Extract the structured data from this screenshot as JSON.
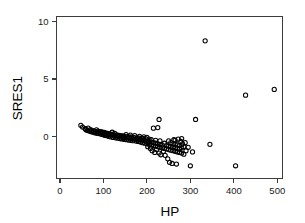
{
  "chart_data": {
    "type": "scatter",
    "title": "",
    "xlabel": "HP",
    "ylabel": "SRES1",
    "xlim": [
      -8,
      512
    ],
    "ylim": [
      -3.6,
      10.4
    ],
    "xticks": [
      0,
      100,
      200,
      300,
      400,
      500
    ],
    "yticks": [
      0,
      5,
      10
    ],
    "xtick_labels": [
      "0",
      "100",
      "200",
      "300",
      "400",
      "500"
    ],
    "ytick_labels": [
      "0",
      "5",
      "10"
    ],
    "grid": false,
    "legend": null,
    "marker": "open-circle",
    "marker_color": "#000000",
    "marker_size": 4.2,
    "points": [
      [
        48,
        1.0
      ],
      [
        52,
        0.85
      ],
      [
        58,
        0.7
      ],
      [
        60,
        0.62
      ],
      [
        63,
        0.55
      ],
      [
        65,
        0.75
      ],
      [
        67,
        0.5
      ],
      [
        70,
        0.62
      ],
      [
        72,
        0.45
      ],
      [
        74,
        0.55
      ],
      [
        76,
        0.4
      ],
      [
        78,
        0.5
      ],
      [
        80,
        0.35
      ],
      [
        82,
        0.45
      ],
      [
        84,
        0.6
      ],
      [
        85,
        0.3
      ],
      [
        87,
        0.42
      ],
      [
        88,
        0.5
      ],
      [
        90,
        0.28
      ],
      [
        92,
        0.38
      ],
      [
        94,
        0.45
      ],
      [
        95,
        0.22
      ],
      [
        96,
        0.33
      ],
      [
        98,
        0.4
      ],
      [
        100,
        0.18
      ],
      [
        101,
        0.3
      ],
      [
        102,
        0.38
      ],
      [
        104,
        0.12
      ],
      [
        105,
        0.25
      ],
      [
        106,
        0.33
      ],
      [
        108,
        0.1
      ],
      [
        110,
        0.2
      ],
      [
        110,
        0.3
      ],
      [
        112,
        0.05
      ],
      [
        113,
        0.18
      ],
      [
        115,
        0.26
      ],
      [
        116,
        0.0
      ],
      [
        118,
        0.14
      ],
      [
        120,
        0.22
      ],
      [
        120,
        0.4
      ],
      [
        122,
        -0.05
      ],
      [
        124,
        0.1
      ],
      [
        125,
        0.18
      ],
      [
        126,
        0.3
      ],
      [
        128,
        -0.08
      ],
      [
        130,
        0.06
      ],
      [
        131,
        0.16
      ],
      [
        133,
        -0.12
      ],
      [
        135,
        0.02
      ],
      [
        136,
        0.12
      ],
      [
        138,
        -0.15
      ],
      [
        140,
        -0.02
      ],
      [
        140,
        0.1
      ],
      [
        142,
        -0.18
      ],
      [
        145,
        -0.05
      ],
      [
        145,
        0.08
      ],
      [
        148,
        -0.22
      ],
      [
        150,
        -0.08
      ],
      [
        150,
        0.05
      ],
      [
        152,
        0.2
      ],
      [
        153,
        -0.25
      ],
      [
        155,
        -0.1
      ],
      [
        155,
        0.02
      ],
      [
        158,
        -0.28
      ],
      [
        160,
        -0.12
      ],
      [
        160,
        0.0
      ],
      [
        162,
        0.15
      ],
      [
        163,
        -0.3
      ],
      [
        165,
        -0.15
      ],
      [
        165,
        -0.02
      ],
      [
        168,
        -0.33
      ],
      [
        170,
        -0.18
      ],
      [
        170,
        -0.05
      ],
      [
        172,
        0.1
      ],
      [
        175,
        -0.36
      ],
      [
        175,
        -0.2
      ],
      [
        178,
        -0.08
      ],
      [
        180,
        -0.4
      ],
      [
        180,
        -0.22
      ],
      [
        182,
        -0.1
      ],
      [
        183,
        0.05
      ],
      [
        185,
        -0.45
      ],
      [
        185,
        -0.25
      ],
      [
        188,
        -0.12
      ],
      [
        190,
        -0.5
      ],
      [
        190,
        -0.3
      ],
      [
        192,
        -0.15
      ],
      [
        193,
        0.0
      ],
      [
        195,
        -0.55
      ],
      [
        195,
        -0.35
      ],
      [
        198,
        -0.18
      ],
      [
        200,
        -0.6
      ],
      [
        200,
        -0.38
      ],
      [
        200,
        -0.05
      ],
      [
        202,
        -0.85
      ],
      [
        205,
        -0.65
      ],
      [
        205,
        -0.42
      ],
      [
        205,
        -0.2
      ],
      [
        208,
        -1.0
      ],
      [
        210,
        -0.7
      ],
      [
        210,
        -0.45
      ],
      [
        210,
        -0.25
      ],
      [
        212,
        -1.2
      ],
      [
        215,
        -0.75
      ],
      [
        215,
        -0.5
      ],
      [
        215,
        0.75
      ],
      [
        218,
        -1.35
      ],
      [
        220,
        -0.8
      ],
      [
        220,
        -0.55
      ],
      [
        220,
        -0.3
      ],
      [
        222,
        -1.1
      ],
      [
        225,
        -0.85
      ],
      [
        225,
        -0.6
      ],
      [
        225,
        0.8
      ],
      [
        228,
        -1.4
      ],
      [
        228,
        1.5
      ],
      [
        230,
        -0.9
      ],
      [
        230,
        -0.65
      ],
      [
        230,
        -0.35
      ],
      [
        232,
        -1.55
      ],
      [
        235,
        -0.95
      ],
      [
        235,
        -0.7
      ],
      [
        238,
        -1.25
      ],
      [
        240,
        -1.0
      ],
      [
        240,
        -0.55
      ],
      [
        242,
        -1.6
      ],
      [
        245,
        -1.05
      ],
      [
        245,
        -0.75
      ],
      [
        248,
        -1.9
      ],
      [
        250,
        -1.1
      ],
      [
        250,
        -0.8
      ],
      [
        250,
        -0.35
      ],
      [
        252,
        -2.2
      ],
      [
        255,
        -1.15
      ],
      [
        255,
        -0.85
      ],
      [
        255,
        -0.5
      ],
      [
        258,
        -2.3
      ],
      [
        260,
        -1.2
      ],
      [
        260,
        -0.9
      ],
      [
        260,
        -0.6
      ],
      [
        262,
        -0.25
      ],
      [
        265,
        -1.25
      ],
      [
        265,
        -0.95
      ],
      [
        265,
        -0.65
      ],
      [
        265,
        -0.3
      ],
      [
        268,
        -2.35
      ],
      [
        270,
        -1.3
      ],
      [
        270,
        -1.0
      ],
      [
        270,
        -0.7
      ],
      [
        272,
        -0.2
      ],
      [
        275,
        -1.35
      ],
      [
        275,
        -1.05
      ],
      [
        275,
        -0.75
      ],
      [
        278,
        -0.4
      ],
      [
        280,
        -1.4
      ],
      [
        280,
        -0.95
      ],
      [
        280,
        -0.15
      ],
      [
        282,
        -0.6
      ],
      [
        285,
        -1.5
      ],
      [
        285,
        -0.85
      ],
      [
        288,
        -0.5
      ],
      [
        290,
        -1.2
      ],
      [
        295,
        -0.9
      ],
      [
        300,
        -2.5
      ],
      [
        305,
        -1.3
      ],
      [
        312,
        1.5
      ],
      [
        334,
        8.3
      ],
      [
        345,
        -0.65
      ],
      [
        404,
        -2.5
      ],
      [
        427,
        3.6
      ],
      [
        493,
        4.1
      ]
    ]
  },
  "axes": {
    "x_title": "HP",
    "y_title": "SRES1"
  }
}
